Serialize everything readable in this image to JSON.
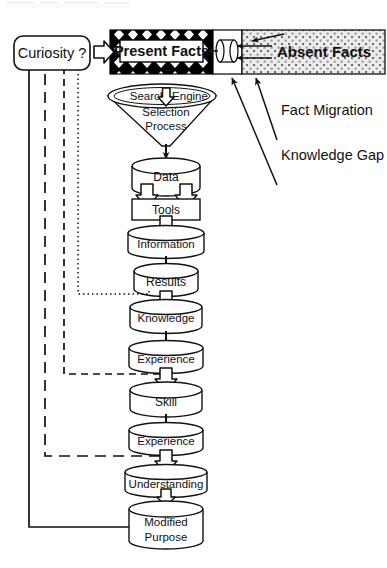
{
  "diagram": {
    "source_box": {
      "label": "Curiosity ?"
    },
    "facts_band": {
      "present": {
        "label": "Present Facts",
        "fill": "#000000",
        "pattern": "black-with-white-diamonds"
      },
      "absent": {
        "label": "Absent Facts",
        "fill": "#e8e8e8",
        "pattern": "gray-stipple-dots"
      },
      "conduit": {
        "name": "migration-conduit",
        "pattern": "white"
      }
    },
    "callouts": [
      {
        "id": "fact-migration",
        "label": "Fact Migration"
      },
      {
        "id": "knowledge-gap",
        "label": "Knowledge Gap"
      }
    ],
    "funnel": {
      "ellipse_left": "Search",
      "ellipse_right": "Engine",
      "ellipse_icon": "down-block-arrow-icon",
      "body_line1": "Selection",
      "body_line2": "Process"
    },
    "stages": [
      {
        "id": "data",
        "label": "Data",
        "shape": "cylinder"
      },
      {
        "id": "tools",
        "label": "Tools",
        "shape": "rect"
      },
      {
        "id": "information",
        "label": "Information",
        "shape": "cylinder"
      },
      {
        "id": "results",
        "label": "Results",
        "shape": "cylinder"
      },
      {
        "id": "knowledge",
        "label": "Knowledge",
        "shape": "cylinder"
      },
      {
        "id": "experience-1",
        "label": "Experience",
        "shape": "cylinder"
      },
      {
        "id": "skill",
        "label": "Skill",
        "shape": "cylinder"
      },
      {
        "id": "experience-2",
        "label": "Experience",
        "shape": "cylinder"
      },
      {
        "id": "understanding",
        "label": "Understanding",
        "shape": "cylinder"
      },
      {
        "id": "modified-purpose",
        "label": "Modified",
        "label2": "Purpose",
        "shape": "cylinder"
      }
    ],
    "feedback_lines": [
      {
        "id": "feedback-dotted",
        "from": "results",
        "style": "dotted"
      },
      {
        "id": "feedback-dash-short",
        "from": "experience-1",
        "style": "dashed-medium"
      },
      {
        "id": "feedback-dash-long",
        "from": "experience-2",
        "style": "dashed-long"
      },
      {
        "id": "feedback-solid",
        "from": "modified-purpose",
        "style": "solid"
      }
    ],
    "colors": {
      "ink": "#1a1a1a",
      "stroke": "#000000",
      "absent_fill": "#e9e9e9",
      "gray_text": "#222222"
    }
  }
}
